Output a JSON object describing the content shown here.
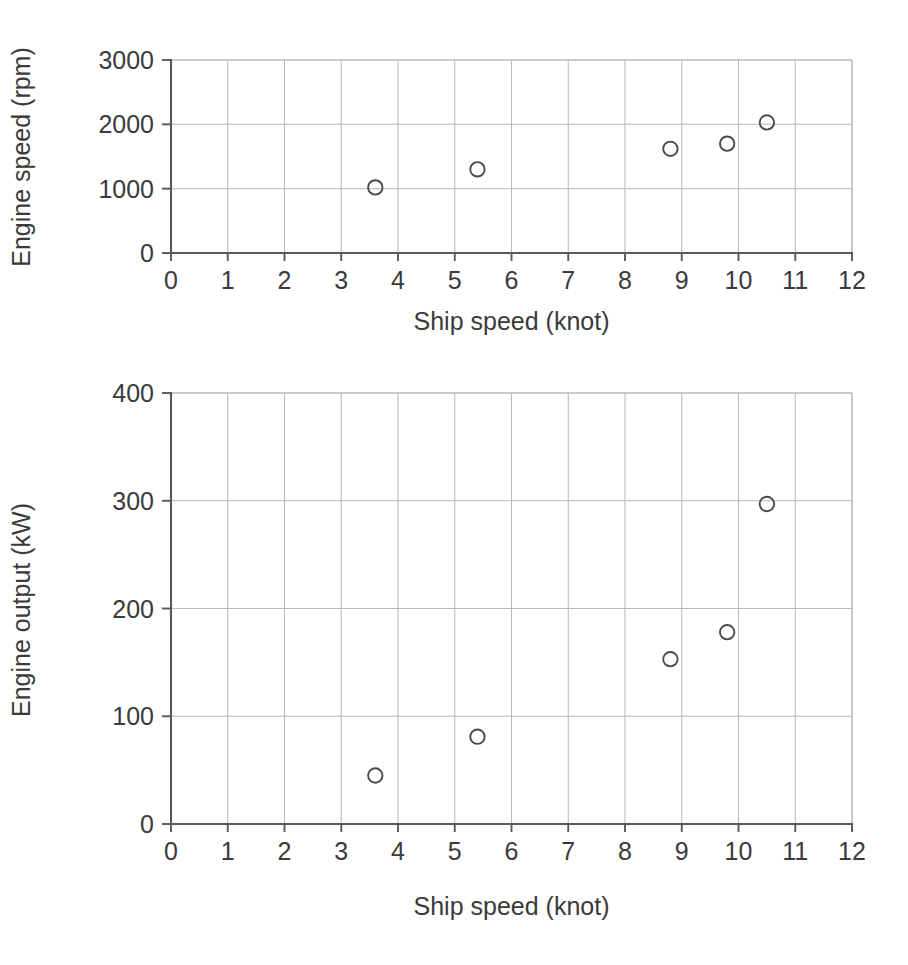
{
  "chart_data": [
    {
      "id": "engine-speed-vs-ship-speed",
      "type": "scatter",
      "title": "",
      "xlabel": "Ship speed (knot)",
      "ylabel": "Engine speed (rpm)",
      "xlim": [
        0,
        12
      ],
      "ylim": [
        0,
        3000
      ],
      "xticks": [
        0,
        1,
        2,
        3,
        4,
        5,
        6,
        7,
        8,
        9,
        10,
        11,
        12
      ],
      "xticklabels": [
        "0",
        "1",
        "2",
        "3",
        "4",
        "5",
        "6",
        "7",
        "8",
        "9",
        "10",
        "11",
        "12"
      ],
      "yticks": [
        0,
        1000,
        2000,
        3000
      ],
      "yticklabels": [
        "0",
        "1000",
        "2000",
        "3000"
      ],
      "grid": "both",
      "legend": "none",
      "marker": "open-circle",
      "marker_color": "#4a4a4a",
      "series": [
        {
          "name": "Engine speed",
          "points": [
            {
              "x": 3.6,
              "y": 1020
            },
            {
              "x": 5.4,
              "y": 1300
            },
            {
              "x": 8.8,
              "y": 1620
            },
            {
              "x": 9.8,
              "y": 1700
            },
            {
              "x": 10.5,
              "y": 2030
            }
          ]
        }
      ]
    },
    {
      "id": "engine-output-vs-ship-speed",
      "type": "scatter",
      "title": "",
      "xlabel": "Ship speed (knot)",
      "ylabel": "Engine output (kW)",
      "xlim": [
        0,
        12
      ],
      "ylim": [
        0,
        400
      ],
      "xticks": [
        0,
        1,
        2,
        3,
        4,
        5,
        6,
        7,
        8,
        9,
        10,
        11,
        12
      ],
      "xticklabels": [
        "0",
        "1",
        "2",
        "3",
        "4",
        "5",
        "6",
        "7",
        "8",
        "9",
        "10",
        "11",
        "12"
      ],
      "yticks": [
        0,
        100,
        200,
        300,
        400
      ],
      "yticklabels": [
        "0",
        "100",
        "200",
        "300",
        "400"
      ],
      "grid": "both",
      "legend": "none",
      "marker": "open-circle",
      "marker_color": "#4a4a4a",
      "series": [
        {
          "name": "Engine output",
          "points": [
            {
              "x": 3.6,
              "y": 45
            },
            {
              "x": 5.4,
              "y": 81
            },
            {
              "x": 8.8,
              "y": 153
            },
            {
              "x": 9.8,
              "y": 178
            },
            {
              "x": 10.5,
              "y": 297
            }
          ]
        }
      ]
    }
  ],
  "colors": {
    "background": "#ffffff",
    "axis": "#595959",
    "grid": "#b9b9b9",
    "text": "#3a3a3a",
    "marker": "#4a4a4a"
  }
}
